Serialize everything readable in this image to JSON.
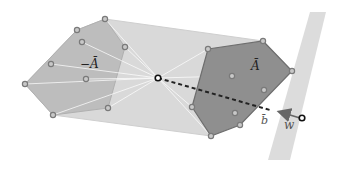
{
  "diagram": {
    "labels": {
      "neg_a_bar": "−Ā",
      "a_bar": "Ā",
      "b_bar": "b̄",
      "w": "w"
    },
    "colors": {
      "outer_hull": "#d6d6d6",
      "left_polygon": "#bdbdbd",
      "right_polygon": "#8f8f8f",
      "right_polygon_edge": "#6e6e6e",
      "band": "#dcdcdc",
      "point_fill": "#c8c8c8",
      "point_stroke": "#7a7a7a",
      "center_point": "#111111",
      "dashed_line": "#222222",
      "arrow": "#666666"
    },
    "outer_hull": [
      [
        105,
        19
      ],
      [
        263,
        41
      ],
      [
        292,
        71
      ],
      [
        211,
        136
      ],
      [
        53,
        115
      ],
      [
        25,
        84
      ],
      [
        77,
        30
      ]
    ],
    "left_polygon": [
      [
        105,
        19
      ],
      [
        125,
        47
      ],
      [
        108,
        108
      ],
      [
        53,
        115
      ],
      [
        25,
        84
      ],
      [
        77,
        30
      ]
    ],
    "right_polygon": [
      [
        208,
        49
      ],
      [
        263,
        41
      ],
      [
        292,
        71
      ],
      [
        240,
        125
      ],
      [
        211,
        136
      ],
      [
        192,
        107
      ]
    ],
    "band": [
      [
        310,
        12
      ],
      [
        326,
        12
      ],
      [
        290,
        160
      ],
      [
        268,
        160
      ]
    ],
    "center_point": [
      158,
      78
    ],
    "w_point": [
      302,
      118
    ],
    "b_point": [
      277,
      112
    ]
  }
}
